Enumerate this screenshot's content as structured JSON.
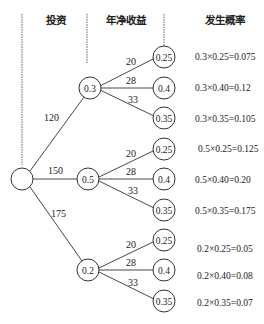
{
  "headers": {
    "investment": "投资",
    "net_income": "年净收益",
    "probability": "发生概率"
  },
  "root": {
    "label": ""
  },
  "branches": [
    {
      "investment": "120",
      "probability_node": "0.3",
      "leaves": [
        {
          "income": "20",
          "prob": "0.25",
          "result": "0.3×0.25=0.075"
        },
        {
          "income": "28",
          "prob": "0.4",
          "result": "0.3×0.40=0.12"
        },
        {
          "income": "33",
          "prob": "0.35",
          "result": "0.3×0.35=0.105"
        }
      ]
    },
    {
      "investment": "150",
      "probability_node": "0.5",
      "leaves": [
        {
          "income": "20",
          "prob": "0.25",
          "result": "0.5×0.25=0.125"
        },
        {
          "income": "28",
          "prob": "0.4",
          "result": "0.5×0.40=0.20"
        },
        {
          "income": "33",
          "prob": "0.35",
          "result": "0.5×0.35=0.175"
        }
      ]
    },
    {
      "investment": "175",
      "probability_node": "0.2",
      "leaves": [
        {
          "income": "20",
          "prob": "0.25",
          "result": "0.2×0.25=0.05"
        },
        {
          "income": "28",
          "prob": "0.4",
          "result": "0.2×0.40=0.08"
        },
        {
          "income": "33",
          "prob": "0.35",
          "result": "0.2×0.35=0.07"
        }
      ]
    }
  ]
}
